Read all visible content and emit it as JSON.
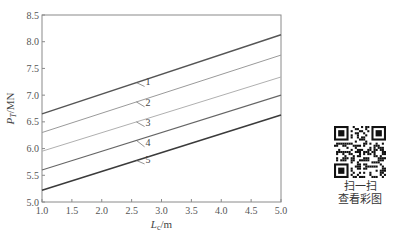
{
  "chart_data": {
    "type": "line",
    "title": "",
    "xlabel": "L",
    "xlabel_sub": "c",
    "xlabel_unit": "/m",
    "ylabel": "P",
    "ylabel_sub": "T",
    "ylabel_unit": "/MN",
    "xlim": [
      1.0,
      5.0
    ],
    "ylim": [
      5.0,
      8.5
    ],
    "xticks": [
      "1.0",
      "1.5",
      "2.0",
      "2.5",
      "3.0",
      "3.5",
      "4.0",
      "4.5",
      "5.0"
    ],
    "yticks": [
      "5.0",
      "5.5",
      "6.0",
      "6.5",
      "7.0",
      "7.5",
      "8.0",
      "8.5"
    ],
    "grid": false,
    "x": [
      1.0,
      5.0
    ],
    "series": [
      {
        "name": "1",
        "values": [
          6.65,
          8.13
        ],
        "color": "#555555",
        "width": 1.4,
        "label_x": 2.7,
        "label_y": 7.2
      },
      {
        "name": "2",
        "values": [
          6.3,
          7.75
        ],
        "color": "#9a9a9a",
        "width": 1.0,
        "label_x": 2.7,
        "label_y": 6.82
      },
      {
        "name": "3",
        "values": [
          5.95,
          7.34
        ],
        "color": "#b0b0b0",
        "width": 1.0,
        "label_x": 2.7,
        "label_y": 6.45
      },
      {
        "name": "4",
        "values": [
          5.6,
          7.0
        ],
        "color": "#666666",
        "width": 1.1,
        "label_x": 2.7,
        "label_y": 6.07
      },
      {
        "name": "5",
        "values": [
          5.22,
          6.63
        ],
        "color": "#3a3a3a",
        "width": 1.5,
        "label_x": 2.7,
        "label_y": 5.75
      }
    ]
  },
  "qr": {
    "line1": "扫一扫",
    "line2": "查看彩图"
  }
}
